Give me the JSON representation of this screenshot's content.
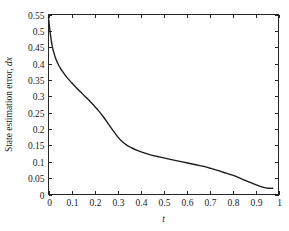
{
  "figure": {
    "background_color": "#ffffff",
    "frame_color": "#262626",
    "curve_color": "#1a1a1a"
  },
  "axes": {
    "x_title_plain": "t",
    "y_title_plain": "State estimation error, dx",
    "y_title_prefix": "State estimation error, ",
    "y_title_italic": "dx",
    "x_tick_labels": [
      "0",
      "0.1",
      "0.2",
      "0.3",
      "0.4",
      "0.5",
      "0.6",
      "0.7",
      "0.8",
      "0.9",
      "1"
    ],
    "y_tick_labels": [
      "0",
      "0.05",
      "0.1",
      "0.15",
      "0.2",
      "0.25",
      "0.3",
      "0.35",
      "0.4",
      "0.45",
      "0.5",
      "0.55"
    ]
  },
  "chart_data": {
    "type": "line",
    "title": "",
    "xlabel": "t",
    "ylabel": "State estimation error, dx",
    "xlim": [
      0,
      1
    ],
    "ylim": [
      0,
      0.55
    ],
    "xticks": [
      0,
      0.1,
      0.2,
      0.3,
      0.4,
      0.5,
      0.6,
      0.7,
      0.8,
      0.9,
      1
    ],
    "yticks": [
      0,
      0.05,
      0.1,
      0.15,
      0.2,
      0.25,
      0.3,
      0.35,
      0.4,
      0.45,
      0.5,
      0.55
    ],
    "grid": false,
    "legend": null,
    "series": [
      {
        "name": "State estimation error",
        "x": [
          0.0,
          0.005,
          0.01,
          0.015,
          0.02,
          0.03,
          0.04,
          0.05,
          0.06,
          0.08,
          0.1,
          0.12,
          0.14,
          0.16,
          0.18,
          0.2,
          0.22,
          0.24,
          0.26,
          0.28,
          0.3,
          0.32,
          0.34,
          0.36,
          0.38,
          0.4,
          0.44,
          0.48,
          0.52,
          0.56,
          0.6,
          0.64,
          0.68,
          0.7,
          0.72,
          0.76,
          0.8,
          0.84,
          0.88,
          0.9,
          0.92,
          0.94,
          0.96,
          0.975
        ],
        "y": [
          0.54,
          0.508,
          0.48,
          0.458,
          0.441,
          0.418,
          0.401,
          0.388,
          0.377,
          0.358,
          0.342,
          0.327,
          0.313,
          0.299,
          0.285,
          0.27,
          0.254,
          0.236,
          0.216,
          0.196,
          0.177,
          0.162,
          0.151,
          0.143,
          0.136,
          0.131,
          0.122,
          0.115,
          0.109,
          0.103,
          0.097,
          0.091,
          0.085,
          0.081,
          0.077,
          0.068,
          0.059,
          0.048,
          0.036,
          0.03,
          0.025,
          0.021,
          0.019,
          0.019
        ]
      }
    ]
  }
}
